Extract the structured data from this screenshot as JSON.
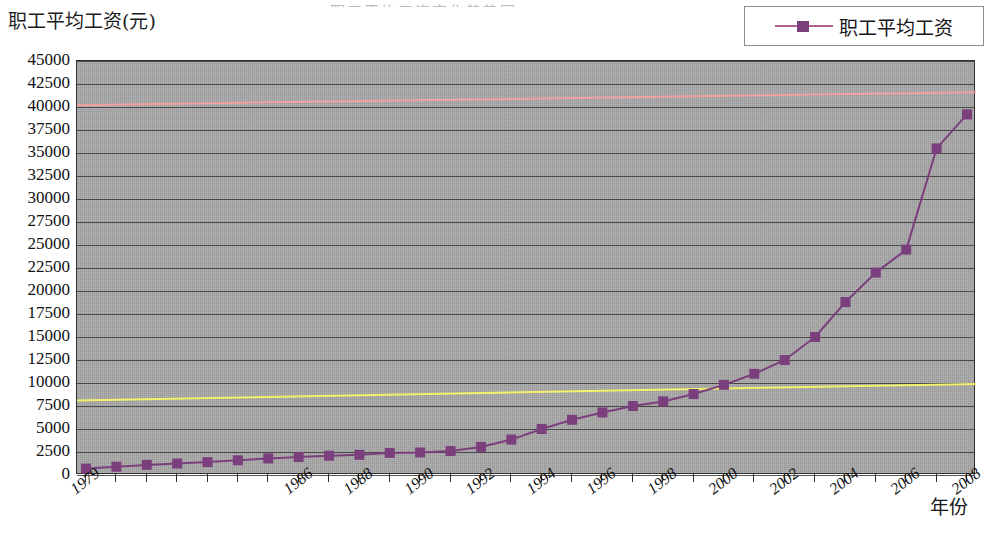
{
  "chart_data": {
    "type": "line",
    "title": "",
    "title_remnant": "职工平均工资变化趋势图",
    "ylabel": "职工平均工资(元)",
    "xlabel": "年份",
    "ylim": [
      0,
      45000
    ],
    "ytick_step": 2500,
    "yticks": [
      45000,
      42500,
      40000,
      37500,
      35000,
      32500,
      30000,
      27500,
      25000,
      22500,
      20000,
      17500,
      15000,
      12500,
      10000,
      7500,
      5000,
      2500,
      0
    ],
    "ytick_labels": [
      "45000",
      "42500",
      "40000",
      "37500",
      "35000",
      "32500",
      "30000",
      "27500",
      "25000",
      "22500",
      "20000",
      "17500",
      "15000",
      "12500",
      "10000",
      "7500",
      "5000",
      "2500",
      "0"
    ],
    "grid": true,
    "legend_position": "top-right",
    "legend": [
      "职工平均工资"
    ],
    "categories": [
      "1979",
      "1980",
      "1981",
      "1982",
      "1983",
      "1984",
      "1985",
      "1986",
      "1987",
      "1988",
      "1989",
      "1990",
      "1991",
      "1992",
      "1993",
      "1994",
      "1995",
      "1996",
      "1997",
      "1998",
      "1999",
      "2000",
      "2001",
      "2002",
      "2003",
      "2004",
      "2005",
      "2006",
      "2007",
      "2008"
    ],
    "xtick_labels": [
      "1979",
      "1986",
      "1988",
      "1990",
      "1992",
      "1994",
      "1996",
      "1998",
      "2000",
      "2002",
      "2004",
      "2006",
      "2008"
    ],
    "xtick_indices": [
      0,
      7,
      9,
      11,
      13,
      15,
      17,
      19,
      21,
      23,
      25,
      27,
      29
    ],
    "series": [
      {
        "name": "职工平均工资",
        "color": "#7c3f7e",
        "marker": "square",
        "values": [
          700,
          900,
          1100,
          1250,
          1400,
          1600,
          1800,
          1950,
          2100,
          2200,
          2400,
          2450,
          2600,
          3050,
          3850,
          5000,
          6000,
          6800,
          7500,
          8000,
          8800,
          9800,
          11000,
          12500,
          15000,
          18800,
          22000,
          24500,
          27500,
          31000
        ]
      }
    ],
    "reference_lines": [
      {
        "name": "upper-reference-line",
        "color": "#f0a0a0",
        "y_start": 40200,
        "y_end": 41600
      },
      {
        "name": "lower-reference-line",
        "color": "#f2f26a",
        "y_start": 8100,
        "y_end": 9900
      }
    ],
    "extra_points": [
      {
        "label": "2007",
        "value": 35500
      },
      {
        "label": "2008",
        "value": 39200
      }
    ],
    "plot_bg": "#a8a8a8"
  },
  "colors": {
    "series": "#7c3f7e",
    "legend_line": "#b0608f",
    "upper_ref": "#f0a0a0",
    "lower_ref": "#f2f26a",
    "plot_bg": "#a8a8a8",
    "grid": "#3a3a3a",
    "frame": "#2e2e2e"
  }
}
